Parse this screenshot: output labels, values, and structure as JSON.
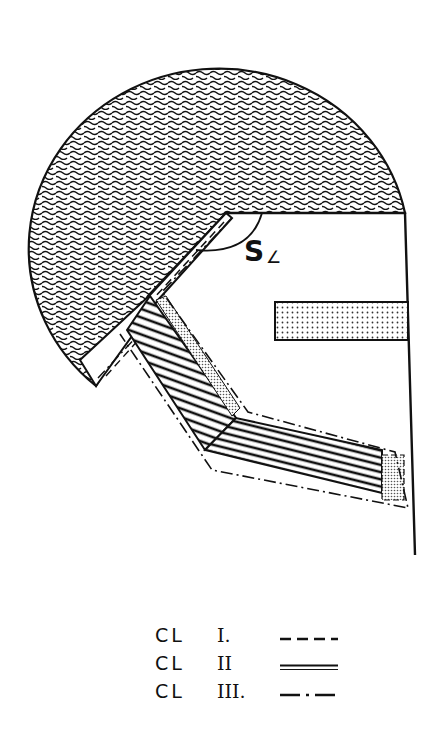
{
  "diagram": {
    "labels": {
      "angle_label": "S",
      "angle_symbol": "∠"
    },
    "regions": [
      {
        "name": "outer-dome",
        "fill": "wavy-texture"
      },
      {
        "name": "bevel-strip",
        "fill": "hatched"
      },
      {
        "name": "shoulder-band",
        "fill": "hatched"
      },
      {
        "name": "inner-stippled-strip",
        "fill": "dotted"
      },
      {
        "name": "horizontal-bar",
        "fill": "dotted"
      },
      {
        "name": "end-stippled-block",
        "fill": "dotted"
      }
    ],
    "colors": {
      "ink": "#111111",
      "background": "#ffffff"
    }
  },
  "legend": {
    "items": [
      {
        "prefix": "CL",
        "class": "I.",
        "line_style": "dashed"
      },
      {
        "prefix": "CL",
        "class": "II",
        "line_style": "double"
      },
      {
        "prefix": "CL",
        "class": "III.",
        "line_style": "dash-dot"
      }
    ]
  }
}
